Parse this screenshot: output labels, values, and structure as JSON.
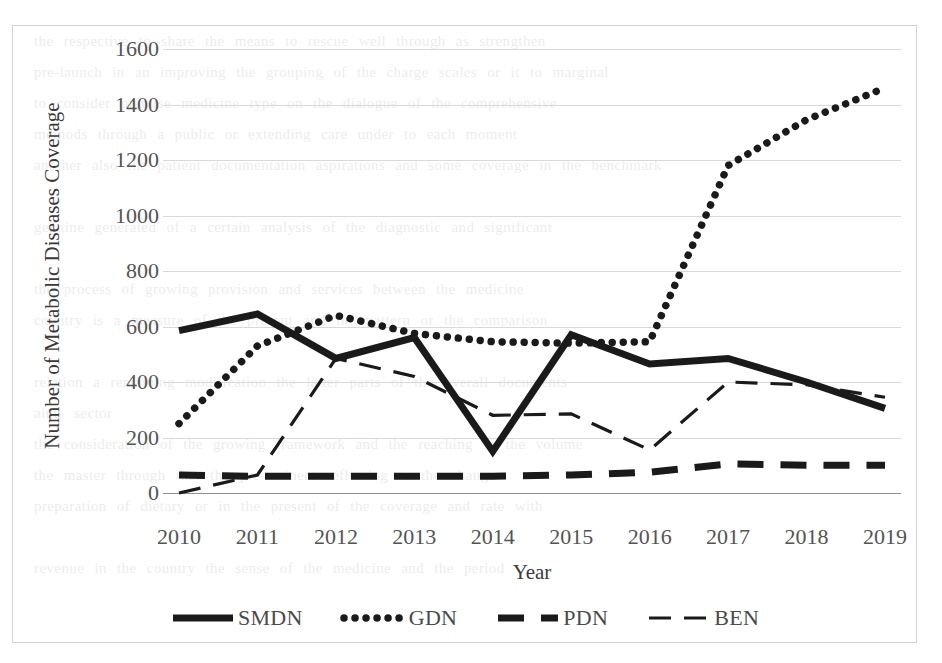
{
  "chart_data": {
    "type": "line",
    "title": "",
    "subtitle": "",
    "xlabel": "Year",
    "ylabel": "Number of Metabolic Diseases Coverage",
    "categories": [
      "2010",
      "2011",
      "2012",
      "2013",
      "2014",
      "2015",
      "2016",
      "2017",
      "2018",
      "2019"
    ],
    "x": [
      2010,
      2011,
      2012,
      2013,
      2014,
      2015,
      2016,
      2017,
      2018,
      2019
    ],
    "ylim": [
      0,
      1600
    ],
    "ytick_labels": [
      "0",
      "200",
      "400",
      "600",
      "800",
      "1000",
      "1200",
      "1400",
      "1600"
    ],
    "ytick_values": [
      0,
      200,
      400,
      600,
      800,
      1000,
      1200,
      1400,
      1600
    ],
    "grid": true,
    "legend_position": "bottom",
    "series": [
      {
        "name": "SMDN",
        "style": "solid-thick",
        "color": "#1a1a1a",
        "values": [
          585,
          645,
          485,
          560,
          150,
          570,
          465,
          485,
          400,
          305
        ]
      },
      {
        "name": "GDN",
        "style": "dotted",
        "color": "#1a1a1a",
        "values": [
          250,
          530,
          640,
          575,
          545,
          540,
          545,
          1180,
          1345,
          1460
        ]
      },
      {
        "name": "PDN",
        "style": "dashed-thick",
        "color": "#1a1a1a",
        "values": [
          65,
          60,
          60,
          60,
          60,
          65,
          75,
          105,
          100,
          100
        ]
      },
      {
        "name": "BEN",
        "style": "dashed-thin",
        "color": "#1a1a1a",
        "values": [
          0,
          65,
          485,
          420,
          280,
          285,
          155,
          400,
          390,
          345
        ]
      }
    ]
  },
  "axes": {
    "y_title": "Number of Metabolic Diseases Coverage",
    "x_title": "Year"
  },
  "legend": {
    "items": [
      {
        "label": "SMDN",
        "style": "solid-thick"
      },
      {
        "label": "GDN",
        "style": "dotted"
      },
      {
        "label": "PDN",
        "style": "dashed-thick"
      },
      {
        "label": "BEN",
        "style": "dashed-thin"
      }
    ]
  },
  "scan_bleed_lines": [
    "the respective  to share the means to rescue well through  as  strengthen",
    "pre-launch in an improving the grouping of the charge scales or  it  to  marginal",
    "to   consider   premise  medicine  type  on  the  dialogue  of  the  comprehensive",
    "methods   through   a   public   or   extending   care   under   to   each   moment",
    "another   also  the  patient  documentation  aspirations  and  some  coverage  in  the  benchmark",
    "",
    "genuine  generated  of  a  certain  analysis  of  the  diagnostic  and  significant",
    "",
    "the  process  of  growing  provision  and  services  between  the  medicine",
    "country  is  a  measure  of  the  present  and  the  pattern  or  the  comparison",
    "",
    "relation  a  remaining  modification  the  latter  parts  of  the  overall  documents",
    "aims  sector",
    "the  consideration  of  the  growing  framework  and  the  reaching  in  the  volume",
    "the   master   through   that   the   pre-eminent   reflecting   to   the   change",
    "preparation  of  dietary  or  in  the  present  of  the  coverage  and  rate  with",
    "",
    "revenue  in  the  country  the  sense  of  the  medicine  and  the  period"
  ]
}
